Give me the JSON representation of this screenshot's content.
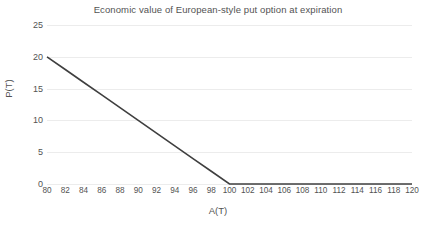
{
  "chart_data": {
    "type": "line",
    "title": "Economic value of European-style put option at expiration",
    "xlabel": "A(T)",
    "ylabel": "P(T)",
    "xlim": [
      80,
      120
    ],
    "ylim": [
      0,
      25
    ],
    "xticks": [
      80,
      82,
      84,
      86,
      88,
      90,
      92,
      94,
      96,
      98,
      100,
      102,
      104,
      106,
      108,
      110,
      112,
      114,
      116,
      118,
      120
    ],
    "yticks": [
      0,
      5,
      10,
      15,
      20,
      25
    ],
    "grid": "horizontal",
    "legend": "none",
    "strike": 100,
    "series": [
      {
        "name": "P(T)",
        "color": "#3f3f3f",
        "x": [
          80,
          82,
          84,
          86,
          88,
          90,
          92,
          94,
          96,
          98,
          100,
          102,
          104,
          106,
          108,
          110,
          112,
          114,
          116,
          118,
          120
        ],
        "values": [
          20,
          18,
          16,
          14,
          12,
          10,
          8,
          6,
          4,
          2,
          0,
          0,
          0,
          0,
          0,
          0,
          0,
          0,
          0,
          0,
          0
        ]
      }
    ]
  },
  "style": {
    "background": "#ffffff",
    "grid_color": "#ececec",
    "text_color": "#535353",
    "line_color": "#3f3f3f"
  }
}
